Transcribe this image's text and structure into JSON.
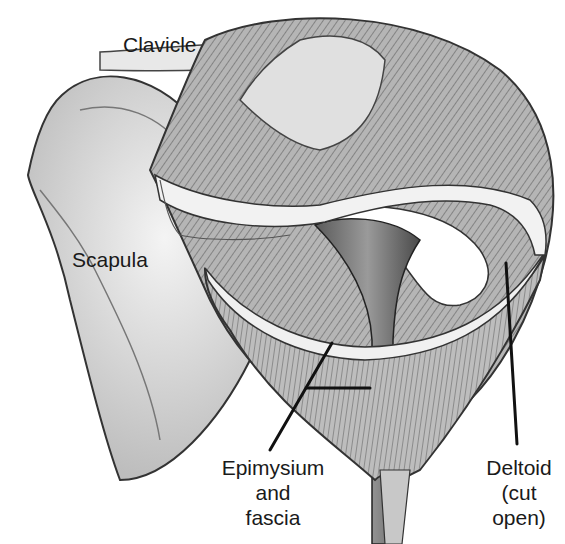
{
  "diagram": {
    "labels": {
      "clavicle": "Clavicle",
      "scapula": "Scapula",
      "epimysium": [
        "Epimysium",
        "and",
        "fascia"
      ],
      "deltoid": [
        "Deltoid",
        "(cut",
        "open)"
      ]
    },
    "colors": {
      "line": "#111111",
      "muscle_dark": "#6b6b6b",
      "muscle_mid": "#9a9a9a",
      "bone": "#e6e6e6",
      "fascia": "#f3f3f3"
    }
  }
}
